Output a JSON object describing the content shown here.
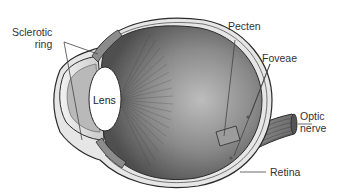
{
  "diagram": {
    "style": "grayscale anatomical illustration",
    "colors": {
      "background": "#ffffff",
      "outline": "#2b2b2b",
      "label_text": "#333333",
      "leader_line": "#444444",
      "chamber_dark": "#5a5a5a",
      "chamber_light": "#bdbdbd",
      "sclera": "#e6e6e6",
      "lens": "#ffffff"
    },
    "labels": [
      {
        "id": "sclerotic-ring",
        "text": "Sclerotic\nring"
      },
      {
        "id": "lens",
        "text": "Lens"
      },
      {
        "id": "pecten",
        "text": "Pecten"
      },
      {
        "id": "foveae",
        "text": "Foveae"
      },
      {
        "id": "optic-nerve",
        "text": "Optic\nnerve"
      },
      {
        "id": "retina",
        "text": "Retina"
      }
    ]
  }
}
